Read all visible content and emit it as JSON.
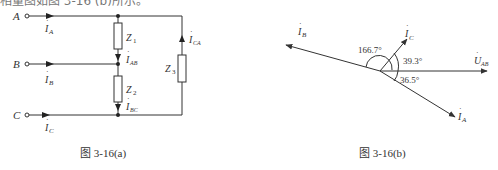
{
  "top_text": "相量图如图 3-16 (b)所示。",
  "figure_a": {
    "caption": "图 3-16(a)",
    "terminals": [
      {
        "name": "A",
        "current": "I",
        "current_sub": "A"
      },
      {
        "name": "B",
        "current": "I",
        "current_sub": "B"
      },
      {
        "name": "C",
        "current": "I",
        "current_sub": "C"
      }
    ],
    "impedances": [
      {
        "label": "Z",
        "sub": "1",
        "current": "I",
        "current_sub": "AB"
      },
      {
        "label": "Z",
        "sub": "2",
        "current": "I",
        "current_sub": "BC"
      },
      {
        "label": "Z",
        "sub": "3",
        "current": "I",
        "current_sub": "CA"
      }
    ]
  },
  "figure_b": {
    "caption": "图 3-16(b)",
    "phasors": [
      {
        "label": "I",
        "sub": "B",
        "angle_label": "166.7°"
      },
      {
        "label": "I",
        "sub": "C",
        "angle_label": "39.3°"
      },
      {
        "label": "U",
        "sub": "AB",
        "angle_label": "0°"
      },
      {
        "label": "I",
        "sub": "A",
        "angle_label": "36.5°"
      }
    ],
    "angles": [
      "166.7°",
      "39.3°",
      "36.5°"
    ]
  },
  "colors": {
    "line": "#333333",
    "background": "#ffffff"
  }
}
